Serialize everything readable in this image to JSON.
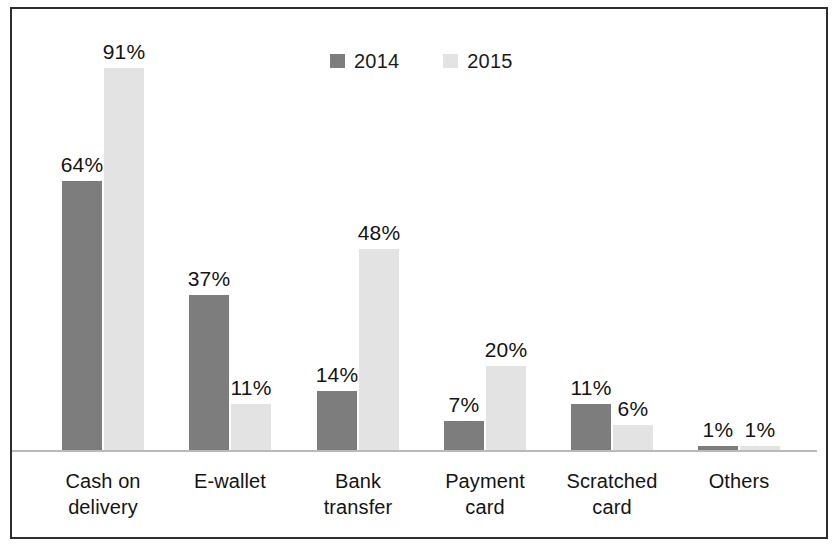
{
  "chart_data": {
    "type": "bar",
    "title": "",
    "subtitle": "",
    "xlabel": "",
    "ylabel": "",
    "ylim": [
      0,
      100
    ],
    "grid": false,
    "legend_position": "top-center",
    "value_suffix": "%",
    "categories": [
      "Cash on delivery",
      "E-wallet",
      "Bank transfer",
      "Payment card",
      "Scratched card",
      "Others"
    ],
    "category_lines": [
      [
        "Cash on",
        "delivery"
      ],
      [
        "E-wallet",
        ""
      ],
      [
        "Bank",
        "transfer"
      ],
      [
        "Payment",
        "card"
      ],
      [
        "Scratched",
        "card"
      ],
      [
        "Others",
        ""
      ]
    ],
    "series": [
      {
        "name": "2014",
        "color": "#7d7d7d",
        "values": [
          64,
          37,
          14,
          7,
          11,
          1
        ],
        "labels": [
          "64%",
          "37%",
          "14%",
          "7%",
          "11%",
          "1%"
        ]
      },
      {
        "name": "2015",
        "color": "#e3e3e3",
        "values": [
          91,
          11,
          48,
          20,
          6,
          1
        ],
        "labels": [
          "91%",
          "11%",
          "48%",
          "20%",
          "6%",
          "1%"
        ]
      }
    ]
  },
  "legend": {
    "entries": [
      {
        "label": "2014",
        "color": "#7d7d7d"
      },
      {
        "label": "2015",
        "color": "#e3e3e3"
      }
    ]
  },
  "style": {
    "frame_color": "#2e2e2e",
    "axis_color": "#b9b9b9",
    "background": "#ffffff",
    "text_color": "#141414"
  }
}
